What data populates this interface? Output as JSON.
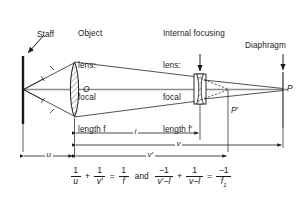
{
  "figure": {
    "background_color": "#ffffff",
    "ink_color": "#1a1a1a",
    "axis_color": "#8c8c8c"
  },
  "labels": {
    "staff": "Staff",
    "object_lens": "Object\nlens:\nfocal\nlength f",
    "object_lens_lines": [
      "Object",
      "lens:",
      "focal",
      "length f"
    ],
    "internal_lens_lines": [
      "Internal focusing",
      "lens:",
      "focal",
      "length f′"
    ],
    "diaphragm": "Diaphragm",
    "lens_center": "O",
    "point_p": "P",
    "point_p_prime": "P′"
  },
  "dimensions": [
    {
      "name": "l",
      "label": "l"
    },
    {
      "name": "v",
      "label": "v"
    },
    {
      "name": "u",
      "label": "u"
    },
    {
      "name": "v-prime",
      "label": "v′"
    }
  ],
  "formula": {
    "eq1": {
      "t1": {
        "num": "1",
        "den": "u"
      },
      "op1": "+",
      "t2": {
        "num": "1",
        "den": "v′"
      },
      "eq": "=",
      "t3": {
        "num": "1",
        "den": "f"
      }
    },
    "conjunction": "and",
    "eq2": {
      "t1": {
        "num": "−1",
        "den": "v′−l"
      },
      "op1": "+",
      "t2": {
        "num": "1",
        "den": "v−l"
      },
      "eq": "=",
      "t3": {
        "num": "−1",
        "den": "f",
        "sub": "1"
      }
    }
  }
}
